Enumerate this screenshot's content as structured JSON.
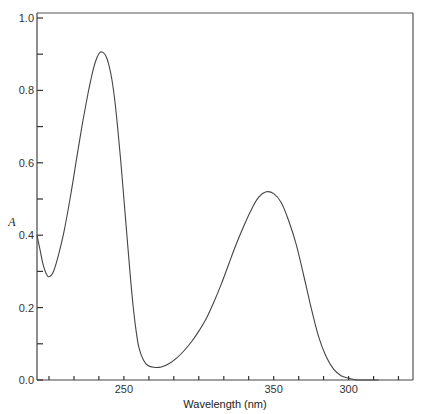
{
  "chart_data": {
    "type": "line",
    "title": "",
    "xlabel": "Wavelength (nm)",
    "ylabel": "A",
    "xlim": [
      192,
      443
    ],
    "ylim": [
      0.0,
      1.0
    ],
    "grid": false,
    "legend": "none",
    "y_ticks": [
      {
        "value": 0.0,
        "label": "0.0"
      },
      {
        "value": 0.1,
        "label": ""
      },
      {
        "value": 0.2,
        "label": "0.2"
      },
      {
        "value": 0.3,
        "label": ""
      },
      {
        "value": 0.4,
        "label": "0.4"
      },
      {
        "value": 0.5,
        "label": ""
      },
      {
        "value": 0.6,
        "label": "0.6"
      },
      {
        "value": 0.7,
        "label": ""
      },
      {
        "value": 0.8,
        "label": "0.8"
      },
      {
        "value": 0.9,
        "label": ""
      },
      {
        "value": 1.0,
        "label": "1.0"
      }
    ],
    "x_ticks": [
      {
        "value": 200.0,
        "label": ""
      },
      {
        "value": 216.7,
        "label": ""
      },
      {
        "value": 233.3,
        "label": ""
      },
      {
        "value": 250.0,
        "label": "250"
      },
      {
        "value": 266.7,
        "label": ""
      },
      {
        "value": 283.3,
        "label": ""
      },
      {
        "value": 300.0,
        "label": ""
      },
      {
        "value": 316.7,
        "label": ""
      },
      {
        "value": 333.3,
        "label": ""
      },
      {
        "value": 350.0,
        "label": "350"
      },
      {
        "value": 366.7,
        "label": ""
      },
      {
        "value": 383.3,
        "label": ""
      },
      {
        "value": 400.0,
        "label": "300"
      },
      {
        "value": 416.7,
        "label": ""
      },
      {
        "value": 433.3,
        "label": ""
      }
    ],
    "series": [
      {
        "name": "absorbance",
        "x": [
          192,
          194,
          196,
          198,
          200,
          203,
          206,
          210,
          214,
          218,
          222,
          226,
          228,
          230,
          232,
          234,
          236,
          238,
          240,
          242,
          244,
          246,
          248,
          250,
          252,
          254,
          256,
          258,
          260,
          263,
          266,
          270,
          275,
          280,
          285,
          290,
          295,
          300,
          305,
          310,
          315,
          320,
          325,
          330,
          335,
          340,
          345,
          350,
          355,
          360,
          365,
          370,
          375,
          380,
          385,
          390,
          395,
          400,
          403,
          406,
          410,
          415,
          420
        ],
        "y": [
          0.4,
          0.36,
          0.32,
          0.295,
          0.285,
          0.3,
          0.34,
          0.41,
          0.5,
          0.6,
          0.7,
          0.79,
          0.83,
          0.865,
          0.89,
          0.905,
          0.905,
          0.895,
          0.87,
          0.83,
          0.77,
          0.69,
          0.6,
          0.5,
          0.4,
          0.3,
          0.21,
          0.14,
          0.09,
          0.055,
          0.04,
          0.035,
          0.036,
          0.045,
          0.06,
          0.08,
          0.105,
          0.135,
          0.17,
          0.215,
          0.265,
          0.32,
          0.375,
          0.425,
          0.47,
          0.505,
          0.52,
          0.515,
          0.49,
          0.44,
          0.375,
          0.29,
          0.2,
          0.12,
          0.065,
          0.03,
          0.012,
          0.005,
          0.002,
          0.0,
          0.0,
          0.0,
          0.0
        ]
      }
    ]
  }
}
